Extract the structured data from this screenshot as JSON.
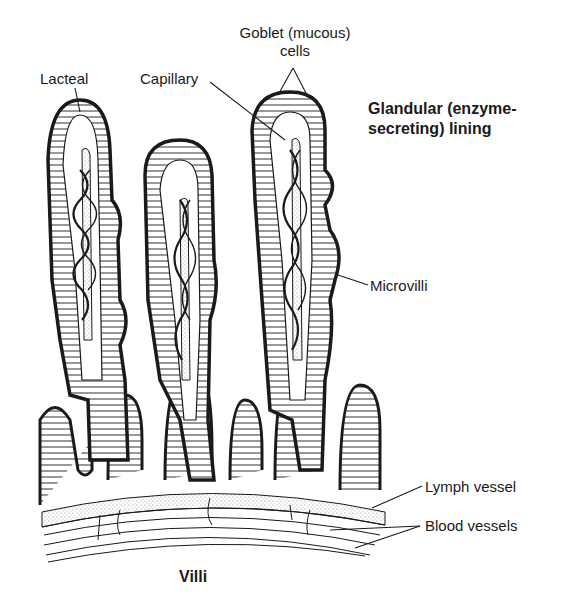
{
  "diagram": {
    "title": "Villi",
    "labels": {
      "lacteal": "Lacteal",
      "capillary": "Capillary",
      "goblet_line1": "Goblet (mucous)",
      "goblet_line2": "cells",
      "glandular_line1": "Glandular (enzyme-",
      "glandular_line2": "secreting) lining",
      "microvilli": "Microvilli",
      "lymph_vessel": "Lymph vessel",
      "blood_vessels": "Blood vessels"
    },
    "colors": {
      "ink": "#1a1a1a",
      "stipple": "#cfcfcf",
      "background": "#ffffff"
    }
  }
}
